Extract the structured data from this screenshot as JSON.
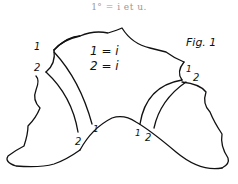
{
  "caption": "1° = i et u.",
  "figure": {
    "title": "Fig. 1",
    "legend": [
      "1 = i",
      "2 = i"
    ],
    "labels": {
      "top_left_1": "1",
      "top_left_2": "2",
      "top_right_1": "1",
      "top_right_2": "2",
      "bottom_left_2": "2",
      "bottom_left_1": "1",
      "bottom_right_1": "1",
      "bottom_right_2": "2"
    }
  }
}
